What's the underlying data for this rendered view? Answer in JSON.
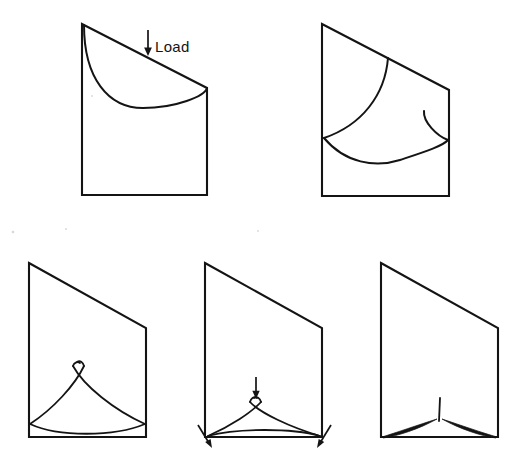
{
  "sheet": {
    "title": "Slope Failure Progression Diagram",
    "background_color": "#ffffff",
    "ink_color": "#141414",
    "width": 528,
    "height": 472
  },
  "annotations": {
    "load_label": "Load"
  },
  "figures": [
    {
      "id": "figure-1",
      "name": "slope-with-applied-load",
      "position": "top-left",
      "caption": "",
      "elements": [
        "slope-body-outline",
        "circular-slip-arc",
        "load-arrow",
        "load-label"
      ]
    },
    {
      "id": "figure-2",
      "name": "slope-with-two-intersecting-arcs",
      "position": "top-right",
      "caption": "",
      "elements": [
        "slope-body-outline",
        "upper-slip-arc",
        "secondary-slip-arc",
        "basal-slip-arc"
      ]
    },
    {
      "id": "figure-3",
      "name": "slope-with-crossed-wedge-arcs",
      "position": "bottom-left",
      "caption": "",
      "elements": [
        "slope-body-outline",
        "left-wedge-arc",
        "right-wedge-arc",
        "basal-arc",
        "apex-crossing"
      ]
    },
    {
      "id": "figure-4",
      "name": "slope-with-load-and-reaction-arrows",
      "position": "bottom-middle",
      "caption": "",
      "elements": [
        "slope-body-outline",
        "left-wedge-arc",
        "right-wedge-arc",
        "basal-arc",
        "apex-crossing",
        "vertical-load-arrow",
        "left-reaction-arrow",
        "right-reaction-arrow"
      ]
    },
    {
      "id": "figure-5",
      "name": "collapsed-slope-state",
      "position": "bottom-right",
      "caption": "",
      "elements": [
        "slope-body-outline",
        "left-collapse-sliver",
        "right-collapse-sliver",
        "center-crack-tick"
      ]
    }
  ]
}
